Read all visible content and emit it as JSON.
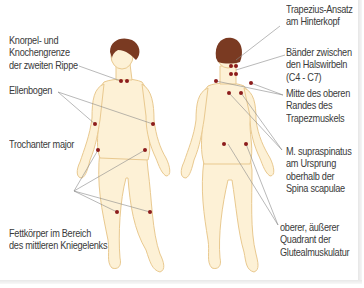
{
  "colors": {
    "skin": "#fdf1d6",
    "skin_outline": "#e9c98f",
    "hair": "#7a3a22",
    "point": "#8c1c1c",
    "leader_line": "#8a8a8a",
    "text": "#3a3a3a"
  },
  "figures": [
    {
      "name": "front-figure",
      "view": "Vorderansicht"
    },
    {
      "name": "back-figure",
      "view": "Rückansicht"
    }
  ],
  "labels_left": [
    {
      "id": "rippe",
      "lines": [
        "Knorpel- und",
        "Knochengrenze",
        "der zweiten Rippe"
      ]
    },
    {
      "id": "ellenbogen",
      "lines": [
        "Ellenbogen"
      ]
    },
    {
      "id": "trochanter",
      "lines": [
        "Trochanter major"
      ]
    },
    {
      "id": "knie",
      "lines": [
        "Fettkörper im Bereich",
        "des mittleren Kniegelenks"
      ]
    }
  ],
  "labels_right": [
    {
      "id": "hinterkopf",
      "lines": [
        "Trapezius-Ansatz",
        "am Hinterkopf"
      ]
    },
    {
      "id": "halswirbel",
      "lines": [
        "Bänder zwischen",
        "den Halswirbeln",
        "(C4 - C7)"
      ]
    },
    {
      "id": "trapez",
      "lines": [
        "Mitte des oberen",
        "Randes des",
        "Trapezmuskels"
      ]
    },
    {
      "id": "supraspinatus",
      "lines": [
        "M. supraspinatus",
        "am Ursprung",
        "oberhalb der",
        "Spina scapulae"
      ]
    },
    {
      "id": "gluteal",
      "lines": [
        "oberer, äußerer",
        "Quadrant der",
        "Glutealmuskulatur"
      ]
    }
  ]
}
